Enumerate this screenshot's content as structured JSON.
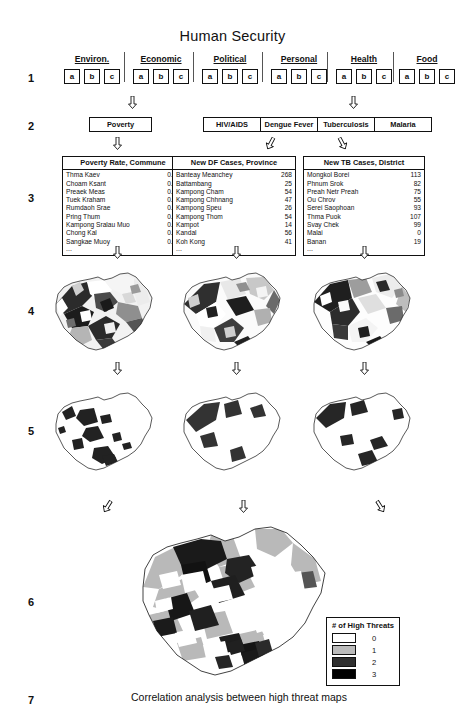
{
  "header": {
    "title": "Human Security"
  },
  "row_numbers": [
    "1",
    "2",
    "3",
    "4",
    "5",
    "6",
    "7"
  ],
  "level1": {
    "categories": [
      {
        "label": "Environ.",
        "boxes": [
          "a",
          "b",
          "c"
        ]
      },
      {
        "label": "Economic",
        "boxes": [
          "a",
          "b",
          "c"
        ]
      },
      {
        "label": "Political",
        "boxes": [
          "a",
          "b",
          "c"
        ]
      },
      {
        "label": "Personal",
        "boxes": [
          "a",
          "b",
          "c"
        ]
      },
      {
        "label": "Health",
        "boxes": [
          "a",
          "b",
          "c"
        ]
      },
      {
        "label": "Food",
        "boxes": [
          "a",
          "b",
          "c"
        ]
      }
    ]
  },
  "level2": {
    "nodes": [
      {
        "label": "Poverty"
      },
      {
        "label": "HIV/AIDS"
      },
      {
        "label": "Dengue Fever"
      },
      {
        "label": "Tuberculosis"
      },
      {
        "label": "Malaria"
      }
    ]
  },
  "level3": {
    "tables": [
      {
        "header": "Poverty Rate, Commune",
        "rows": [
          {
            "name": "Thma Kaev",
            "value": "0.18"
          },
          {
            "name": "Choam Ksant",
            "value": "0.59"
          },
          {
            "name": "Preaek Meas",
            "value": "0.14"
          },
          {
            "name": "Tuek Kraham",
            "value": "0.42"
          },
          {
            "name": "Rumdaoh Srae",
            "value": "0.47"
          },
          {
            "name": "Pring Thum",
            "value": "0.31"
          },
          {
            "name": "Kampong Sralau Muo",
            "value": "0.42"
          },
          {
            "name": "Chong Kal",
            "value": "0.68"
          },
          {
            "name": "Sangkae Muoy",
            "value": "0.73"
          }
        ],
        "more": "..."
      },
      {
        "header": "New DF Cases, Province",
        "rows": [
          {
            "name": "Banteay Meanchey",
            "value": "268"
          },
          {
            "name": "Battambang",
            "value": "25"
          },
          {
            "name": "Kampong Cham",
            "value": "54"
          },
          {
            "name": "Kampong Chhnang",
            "value": "47"
          },
          {
            "name": "Kampong Speu",
            "value": "26"
          },
          {
            "name": "Kampong Thom",
            "value": "54"
          },
          {
            "name": "Kampot",
            "value": "14"
          },
          {
            "name": "Kandal",
            "value": "56"
          },
          {
            "name": "Koh Kong",
            "value": "41"
          }
        ],
        "more": "..."
      },
      {
        "header": "New TB Cases, District",
        "rows": [
          {
            "name": "Mongkol Borei",
            "value": "113"
          },
          {
            "name": "Phnum Srok",
            "value": "82"
          },
          {
            "name": "Preah Netr Preah",
            "value": "75"
          },
          {
            "name": "Ou Chrov",
            "value": "55"
          },
          {
            "name": "Serei Saophoan",
            "value": "93"
          },
          {
            "name": "Thma Puok",
            "value": "107"
          },
          {
            "name": "Svay Chek",
            "value": "99"
          },
          {
            "name": "Malai",
            "value": "0"
          },
          {
            "name": "Banan",
            "value": "19"
          }
        ],
        "more": "..."
      }
    ]
  },
  "level4": {
    "maps": [
      "choropleth-poverty-map",
      "choropleth-dengue-map",
      "choropleth-tb-map"
    ]
  },
  "level5": {
    "maps": [
      "high-threat-poverty-map",
      "high-threat-dengue-map",
      "high-threat-tb-map"
    ]
  },
  "level6": {
    "map": "combined-high-threat-map"
  },
  "legend": {
    "title": "# of High Threats",
    "items": [
      {
        "value": "0",
        "color": "#ffffff"
      },
      {
        "value": "1",
        "color": "#bbbbbb"
      },
      {
        "value": "2",
        "color": "#303030"
      },
      {
        "value": "3",
        "color": "#000000"
      }
    ]
  },
  "caption": "Correlation analysis between high threat maps"
}
